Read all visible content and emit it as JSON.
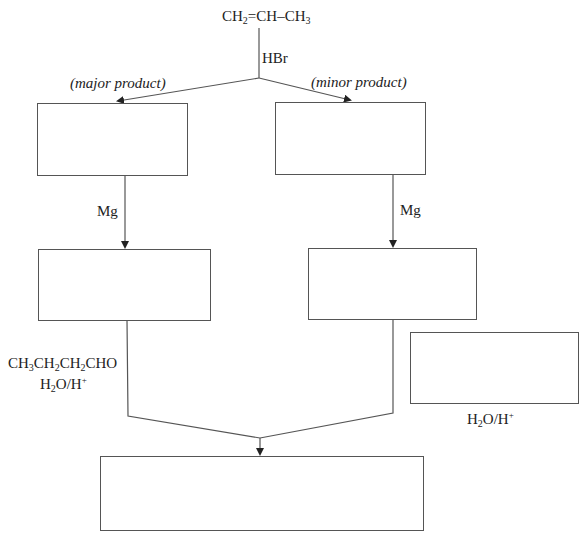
{
  "diagram": {
    "type": "reaction-scheme",
    "starting_material": {
      "parts": [
        "CH",
        "2",
        "=CH–CH",
        "3"
      ],
      "text": "CH2=CH–CH3"
    },
    "reagent_top": "HBr",
    "branches": {
      "left_label": "(major product)",
      "right_label": "(minor product)"
    },
    "step2_reagent_left": "Mg",
    "step2_reagent_right": "Mg",
    "left_reagents": {
      "line1_parts": [
        "CH",
        "3",
        "CH",
        "2",
        "CH",
        "2",
        "CHO"
      ],
      "line1_text": "CH3CH2CH2CHO",
      "line2_parts": [
        "H",
        "2",
        "O/H",
        "+"
      ],
      "line2_text": "H2O/H+"
    },
    "right_side_box_reagent": {
      "parts": [
        "H",
        "2",
        "O/H",
        "+"
      ],
      "text": "H2O/H+"
    },
    "boxes": [
      {
        "id": "box-major-bromide",
        "content": ""
      },
      {
        "id": "box-minor-bromide",
        "content": ""
      },
      {
        "id": "box-major-grignard",
        "content": ""
      },
      {
        "id": "box-minor-grignard",
        "content": ""
      },
      {
        "id": "box-side-reagent",
        "content": ""
      },
      {
        "id": "box-final-product",
        "content": ""
      }
    ]
  }
}
